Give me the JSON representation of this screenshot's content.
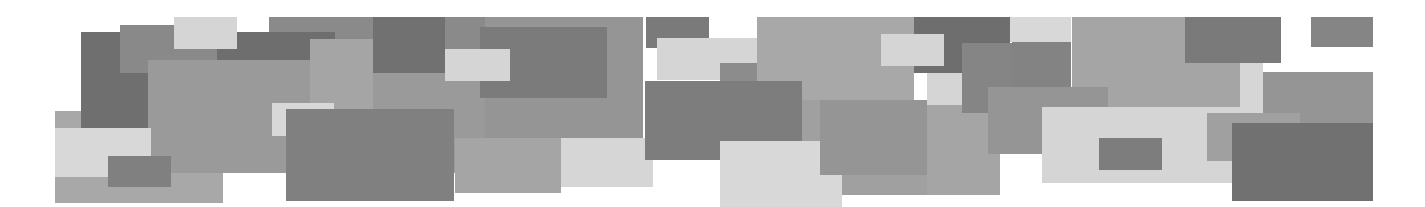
{
  "canvas": {
    "width": 1425,
    "height": 207,
    "background": "#ffffff"
  },
  "palette": {
    "dark": "#707070",
    "medium_dark": "#7f7f7f",
    "medium": "#8e8e8e",
    "medium_mid": "#989898",
    "medium_light": "#a6a6a6",
    "light": "#d6d6d6"
  },
  "rectangles": [
    {
      "x": 55,
      "y": 111,
      "w": 168,
      "h": 92,
      "color": "#a8a8a8"
    },
    {
      "x": 81,
      "y": 32,
      "w": 67,
      "h": 96,
      "color": "#6f6f6f"
    },
    {
      "x": 120,
      "y": 25,
      "w": 97,
      "h": 48,
      "color": "#898989"
    },
    {
      "x": 269,
      "y": 17,
      "w": 216,
      "h": 60,
      "color": "#8a8a8a"
    },
    {
      "x": 217,
      "y": 32,
      "w": 118,
      "h": 28,
      "color": "#6e6e6e"
    },
    {
      "x": 148,
      "y": 60,
      "w": 340,
      "h": 113,
      "color": "#9a9a9a"
    },
    {
      "x": 310,
      "y": 39,
      "w": 63,
      "h": 70,
      "color": "#a5a5a5"
    },
    {
      "x": 373,
      "y": 17,
      "w": 72,
      "h": 56,
      "color": "#717171"
    },
    {
      "x": 174,
      "y": 17,
      "w": 63,
      "h": 32,
      "color": "#d5d5d5"
    },
    {
      "x": 55,
      "y": 128,
      "w": 96,
      "h": 49,
      "color": "#d8d8d8"
    },
    {
      "x": 108,
      "y": 156,
      "w": 63,
      "h": 31,
      "color": "#808080"
    },
    {
      "x": 485,
      "y": 17,
      "w": 158,
      "h": 121,
      "color": "#959595"
    },
    {
      "x": 480,
      "y": 27,
      "w": 127,
      "h": 71,
      "color": "#7b7b7b"
    },
    {
      "x": 445,
      "y": 49,
      "w": 65,
      "h": 32,
      "color": "#d5d5d5"
    },
    {
      "x": 455,
      "y": 138,
      "w": 106,
      "h": 55,
      "color": "#a5a5a5"
    },
    {
      "x": 561,
      "y": 138,
      "w": 92,
      "h": 49,
      "color": "#d6d6d6"
    },
    {
      "x": 272,
      "y": 103,
      "w": 62,
      "h": 33,
      "color": "#d8d8d8"
    },
    {
      "x": 286,
      "y": 109,
      "w": 168,
      "h": 92,
      "color": "#808080"
    },
    {
      "x": 646,
      "y": 17,
      "w": 63,
      "h": 31,
      "color": "#7a7a7a"
    },
    {
      "x": 657,
      "y": 38,
      "w": 100,
      "h": 42,
      "color": "#d5d5d5"
    },
    {
      "x": 720,
      "y": 63,
      "w": 37,
      "h": 18,
      "color": "#8c8c8c"
    },
    {
      "x": 757,
      "y": 17,
      "w": 157,
      "h": 83,
      "color": "#a8a8a8"
    },
    {
      "x": 801,
      "y": 100,
      "w": 126,
      "h": 95,
      "color": "#a0a0a0"
    },
    {
      "x": 645,
      "y": 81,
      "w": 157,
      "h": 79,
      "color": "#7d7d7d"
    },
    {
      "x": 720,
      "y": 141,
      "w": 122,
      "h": 66,
      "color": "#d8d8d8"
    },
    {
      "x": 820,
      "y": 100,
      "w": 107,
      "h": 75,
      "color": "#959595"
    },
    {
      "x": 927,
      "y": 105,
      "w": 73,
      "h": 90,
      "color": "#a5a5a5"
    },
    {
      "x": 914,
      "y": 17,
      "w": 96,
      "h": 56,
      "color": "#6e6e6e"
    },
    {
      "x": 881,
      "y": 34,
      "w": 63,
      "h": 32,
      "color": "#d5d5d5"
    },
    {
      "x": 962,
      "y": 43,
      "w": 50,
      "h": 70,
      "color": "#858585"
    },
    {
      "x": 927,
      "y": 73,
      "w": 35,
      "h": 32,
      "color": "#d5d5d5"
    },
    {
      "x": 1010,
      "y": 17,
      "w": 61,
      "h": 25,
      "color": "#d8d8d8"
    },
    {
      "x": 1012,
      "y": 42,
      "w": 59,
      "h": 45,
      "color": "#838383"
    },
    {
      "x": 1072,
      "y": 17,
      "w": 168,
      "h": 90,
      "color": "#a5a5a5"
    },
    {
      "x": 988,
      "y": 87,
      "w": 120,
      "h": 67,
      "color": "#959595"
    },
    {
      "x": 1042,
      "y": 107,
      "w": 198,
      "h": 76,
      "color": "#d5d5d5"
    },
    {
      "x": 1240,
      "y": 63,
      "w": 23,
      "h": 60,
      "color": "#d6d6d6"
    },
    {
      "x": 1099,
      "y": 138,
      "w": 63,
      "h": 32,
      "color": "#7d7d7d"
    },
    {
      "x": 1185,
      "y": 17,
      "w": 96,
      "h": 46,
      "color": "#7a7a7a"
    },
    {
      "x": 1311,
      "y": 17,
      "w": 62,
      "h": 30,
      "color": "#858585"
    },
    {
      "x": 1263,
      "y": 72,
      "w": 110,
      "h": 51,
      "color": "#959595"
    },
    {
      "x": 1207,
      "y": 113,
      "w": 93,
      "h": 48,
      "color": "#a0a0a0"
    },
    {
      "x": 1232,
      "y": 123,
      "w": 141,
      "h": 78,
      "color": "#717171"
    }
  ]
}
